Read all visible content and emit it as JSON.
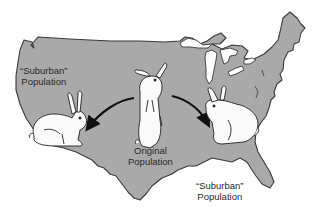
{
  "diagram": {
    "type": "map-illustration",
    "map": {
      "region": "contiguous-united-states",
      "fill_color": "#a9a9a9",
      "outline_color": "#3a3a3a",
      "water_color": "#ffffff"
    },
    "nodes": [
      {
        "id": "original",
        "label_lines": [
          "Original",
          "Population"
        ],
        "icon": "standing-rabbit-icon",
        "position": "center"
      },
      {
        "id": "suburban_west",
        "label_lines": [
          "“Suburban”",
          "Population"
        ],
        "icon": "crouching-rabbit-icon",
        "position": "west"
      },
      {
        "id": "suburban_east",
        "label_lines": [
          "“Suburban”",
          "Population"
        ],
        "icon": "crouching-rabbit-icon",
        "position": "southeast"
      }
    ],
    "edges": [
      {
        "from": "original",
        "to": "suburban_west",
        "style": "curved-arrow"
      },
      {
        "from": "original",
        "to": "suburban_east",
        "style": "curved-arrow"
      }
    ]
  },
  "labels": {
    "left": {
      "line1": "“Suburban”",
      "line2": "Population"
    },
    "center": {
      "line1": "Original",
      "line2": "Population"
    },
    "right": {
      "line1": "“Suburban”",
      "line2": "Population"
    }
  }
}
